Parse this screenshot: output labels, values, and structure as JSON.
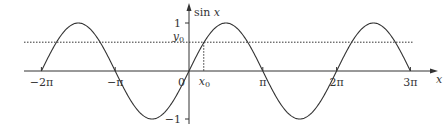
{
  "chart_data": {
    "type": "line",
    "title": "",
    "function": "sin x",
    "xlabel": "x",
    "ylabel": "sin x",
    "x_range_pi": [
      -2,
      3
    ],
    "ylim": [
      -1,
      1
    ],
    "x_ticks": [
      {
        "value_pi": -2,
        "label": "−2π"
      },
      {
        "value_pi": -1,
        "label": "−π"
      },
      {
        "value_pi": 0,
        "label": "0"
      },
      {
        "value_pi": 1,
        "label": "π"
      },
      {
        "value_pi": 2,
        "label": "2π"
      },
      {
        "value_pi": 3,
        "label": "3π"
      }
    ],
    "y_ticks": [
      {
        "value": 1,
        "label": "1"
      },
      {
        "value": -1,
        "label": "−1"
      }
    ],
    "annotations": {
      "y0": {
        "label": "y",
        "subscript": "0",
        "value": 0.6,
        "style": "dotted horizontal line"
      },
      "x0": {
        "label": "x",
        "subscript": "0",
        "value_pi": 0.2,
        "style": "dotted vertical line"
      }
    },
    "grid": false,
    "legend": null,
    "color": "#333333"
  }
}
